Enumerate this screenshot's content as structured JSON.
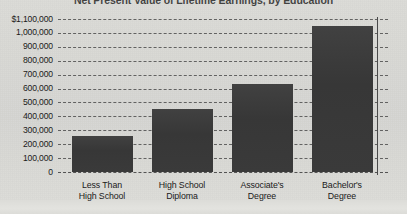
{
  "chart_data": {
    "type": "bar",
    "title": "Net Present Value of Lifetime Earnings, by Education",
    "xlabel": "",
    "ylabel": "",
    "categories": [
      "Less Than\nHigh School",
      "High School\nDiploma",
      "Associate's\nDegree",
      "Bachelor's\nDegree"
    ],
    "category_lines": [
      [
        "Less Than",
        "High School"
      ],
      [
        "High School",
        "Diploma"
      ],
      [
        "Associate's",
        "Degree"
      ],
      [
        "Bachelor's",
        "Degree"
      ]
    ],
    "values": [
      260000,
      450000,
      630000,
      1050000
    ],
    "ylim": [
      0,
      1100000
    ],
    "ytick_values": [
      1100000,
      1000000,
      900000,
      800000,
      700000,
      600000,
      500000,
      400000,
      300000,
      200000,
      100000,
      0
    ],
    "ytick_labels": [
      "$1,100,000",
      "1,000,000",
      "900,000",
      "800,000",
      "700,000",
      "600,000",
      "500,000",
      "400,000",
      "300,000",
      "200,000",
      "100,000",
      "0"
    ],
    "grid": true,
    "grid_style": "dashed",
    "legend": false,
    "bar_color": "#3b3b3b",
    "background_color": "#d9d9d5",
    "grid_color": "#4e4e4e",
    "text_color": "#1a1a1a"
  }
}
